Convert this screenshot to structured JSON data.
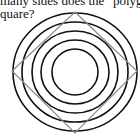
{
  "question": {
    "line1": "many sides does the \"polyg",
    "line2": "quare?"
  },
  "figure": {
    "circle_count": 5,
    "circle_color": "#111111",
    "square_color": "#8a8a8a",
    "center": [
      75,
      72
    ],
    "circles": [
      {
        "rx": 62,
        "ry": 59
      },
      {
        "rx": 53,
        "ry": 50
      },
      {
        "rx": 43,
        "ry": 41
      },
      {
        "rx": 34,
        "ry": 32
      },
      {
        "rx": 23,
        "ry": 23
      }
    ],
    "square_vertices": [
      [
        75,
        12
      ],
      [
        137,
        71
      ],
      [
        75,
        133
      ],
      [
        12,
        71
      ]
    ]
  }
}
